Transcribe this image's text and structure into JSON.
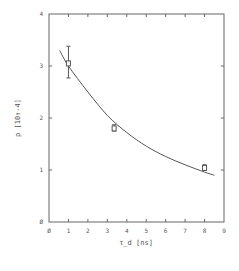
{
  "chart_data": {
    "type": "scatter",
    "title": "",
    "xlabel": "τ_d [ns]",
    "ylabel": "p [10↑-4]",
    "xlim": [
      0,
      9
    ],
    "ylim": [
      0,
      4
    ],
    "xticks": [
      "0",
      "1",
      "2",
      "3",
      "4",
      "5",
      "6",
      "7",
      "8",
      "9"
    ],
    "yticks": [
      "0",
      "1",
      "2",
      "3",
      "4"
    ],
    "grid": false,
    "legend": null,
    "series": [
      {
        "name": "measured",
        "kind": "points",
        "marker": "open-square",
        "points": [
          {
            "x": 1.0,
            "y": 3.05,
            "yerr_low": 2.77,
            "yerr_high": 3.38
          },
          {
            "x": 3.35,
            "y": 1.8,
            "yerr_low": 1.75,
            "yerr_high": 1.87
          },
          {
            "x": 8.0,
            "y": 1.04,
            "yerr_low": 0.99,
            "yerr_high": 1.1
          }
        ]
      },
      {
        "name": "fit",
        "kind": "line",
        "points": [
          {
            "x": 0.55,
            "y": 3.3
          },
          {
            "x": 1.0,
            "y": 3.0
          },
          {
            "x": 2.0,
            "y": 2.5
          },
          {
            "x": 3.0,
            "y": 2.05
          },
          {
            "x": 4.0,
            "y": 1.72
          },
          {
            "x": 5.0,
            "y": 1.46
          },
          {
            "x": 6.0,
            "y": 1.26
          },
          {
            "x": 7.0,
            "y": 1.1
          },
          {
            "x": 8.0,
            "y": 0.96
          },
          {
            "x": 8.5,
            "y": 0.9
          }
        ]
      }
    ],
    "colors": {
      "ink": "#555555",
      "background": "#ffffff"
    }
  }
}
